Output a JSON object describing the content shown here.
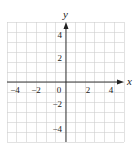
{
  "chart_data": {
    "type": "scatter",
    "title": "",
    "xlabel": "x",
    "ylabel": "y",
    "xlim": [
      -6,
      6
    ],
    "ylim": [
      -6,
      6
    ],
    "grid": true,
    "grid_step": 1,
    "x_ticks": [
      -4,
      -2,
      0,
      2,
      4
    ],
    "y_ticks": [
      4,
      2,
      -2,
      -4
    ],
    "x_tick_labels": [
      "−4",
      "−2",
      "0",
      "2",
      "4"
    ],
    "y_tick_labels": [
      "4",
      "2",
      "−2",
      "−4"
    ],
    "series": [],
    "colors": {
      "grid": "#cfcfcf",
      "axis": "#222222"
    }
  },
  "labels": {
    "x_axis": "x",
    "y_axis": "y",
    "origin": "0",
    "x_neg4": "−4",
    "x_neg2": "−2",
    "x_pos2": "2",
    "x_pos4": "4",
    "y_pos4": "4",
    "y_pos2": "2",
    "y_neg2": "−2",
    "y_neg4": "−4"
  }
}
